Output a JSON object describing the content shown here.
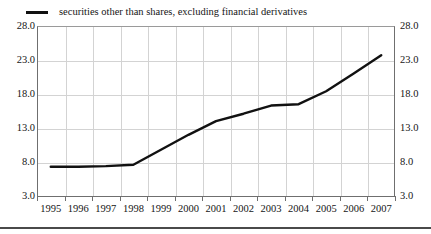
{
  "legend": {
    "label": "securities other than shares, excluding financial derivatives",
    "swatch_color": "#111111",
    "swatch_name": "line-swatch"
  },
  "axes": {
    "y_ticks": [
      "28.0",
      "23.0",
      "18.0",
      "13.0",
      "8.0",
      "3.0"
    ],
    "y_ticks_right": [
      "28.0",
      "23.0",
      "18.0",
      "13.0",
      "8.0",
      "3.0"
    ],
    "x_ticks": [
      "1995",
      "1996",
      "1997",
      "1998",
      "1999",
      "2000",
      "2001",
      "2002",
      "2003",
      "2004",
      "2005",
      "2006",
      "2007"
    ]
  },
  "chart_data": {
    "type": "line",
    "title": "",
    "subtitle": "",
    "xlabel": "",
    "ylabel": "",
    "categories": [
      "1995",
      "1996",
      "1997",
      "1998",
      "1999",
      "2000",
      "2001",
      "2002",
      "2003",
      "2004",
      "2005",
      "2006",
      "2007"
    ],
    "series": [
      {
        "name": "securities other than shares, excluding financial derivatives",
        "color": "#111111",
        "values": [
          7.3,
          7.3,
          7.4,
          7.6,
          9.8,
          12.0,
          14.0,
          15.1,
          16.3,
          16.5,
          18.4,
          21.0,
          23.7
        ]
      }
    ],
    "ylim": [
      3.0,
      28.0
    ],
    "ytick_step": 5.0,
    "grid": true,
    "legend_position": "top-left",
    "dual_y_axis": true
  }
}
